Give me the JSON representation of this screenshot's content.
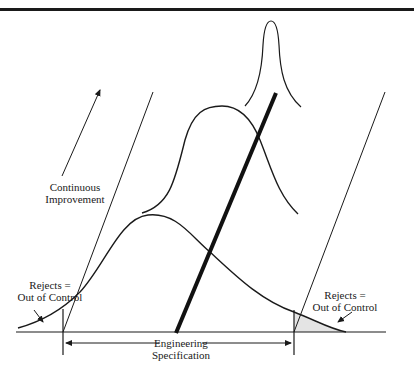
{
  "figure": {
    "type": "process-capability-diagram",
    "labels": {
      "continuous_improvement": [
        "Continuous",
        "Improvement"
      ],
      "rejects_left": [
        "Rejects =",
        "Out of Control"
      ],
      "rejects_right": [
        "Rejects =",
        "Out of Control"
      ],
      "engineering_spec": [
        "Engineering",
        "Specification"
      ]
    },
    "elements": {
      "distributions": [
        {
          "name": "wide",
          "peak": [
            148,
            215
          ],
          "span": [
            18,
            346
          ]
        },
        {
          "name": "medium",
          "peak": [
            222,
            106
          ],
          "span": [
            142,
            298
          ]
        },
        {
          "name": "narrow",
          "peak": [
            271,
            21
          ],
          "span": [
            245,
            301
          ]
        }
      ],
      "trend_line": {
        "from": [
          176,
          333
        ],
        "to": [
          276,
          93
        ],
        "weight": "thick"
      },
      "spec_limits": {
        "lower_x": 63,
        "upper_x": 294
      },
      "baseline_y": 332
    },
    "colors": {
      "ink": "#1a1a1a",
      "shade": "#e6e6e6"
    }
  }
}
